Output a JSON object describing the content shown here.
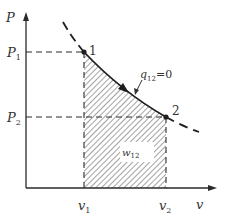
{
  "diagram": {
    "type": "p-v diagram",
    "colors": {
      "ink": "#2a2a2a",
      "hatch": "#555555",
      "background": "#ffffff"
    },
    "axes": {
      "y_label": "P",
      "x_label": "v"
    },
    "ticks": {
      "p1": {
        "base": "P",
        "sub": "1"
      },
      "p2": {
        "base": "P",
        "sub": "2"
      },
      "v1": {
        "base": "v",
        "sub": "1"
      },
      "v2": {
        "base": "v",
        "sub": "2"
      }
    },
    "points": [
      {
        "label": "1"
      },
      {
        "label": "2"
      }
    ],
    "process": {
      "annotation_base": "q",
      "annotation_sub": "12",
      "annotation_value": "=0"
    },
    "work_area": {
      "label_base": "w",
      "label_sub": "12"
    }
  }
}
